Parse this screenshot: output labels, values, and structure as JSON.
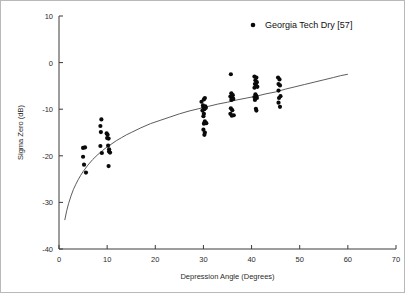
{
  "figure": {
    "background_color": "#ffffff",
    "border_color": "#b9b9b9",
    "marker_color": "#0a0a0a",
    "curve_color": "#4a4a4a",
    "axis_color": "#3a3a3a"
  },
  "legend": {
    "position": "top-right",
    "marker": "filled-circle",
    "entries": [
      {
        "label": "Georgia Tech Dry [57]",
        "marker": "filled-circle",
        "color": "#0a0a0a"
      }
    ]
  },
  "chart_data": {
    "type": "scatter",
    "title": "",
    "xlabel": "Depression Angle (Degrees)",
    "ylabel": "Sigma Zero (dB)",
    "xlim": [
      0,
      70
    ],
    "ylim": [
      -40,
      10
    ],
    "xticks": [
      0,
      10,
      20,
      30,
      40,
      50,
      60,
      70
    ],
    "yticks": [
      10,
      0,
      -10,
      -20,
      -30,
      -40
    ],
    "xticklabels": [
      "0",
      "10",
      "20",
      "30",
      "40",
      "50",
      "60",
      "70"
    ],
    "yticklabels": [
      "10",
      "0",
      "-10",
      "-20",
      "-30",
      "-40"
    ],
    "grid": false,
    "legend_position": "top-right",
    "series": [
      {
        "name": "Georgia Tech Dry [57]",
        "marker": "filled-circle",
        "color": "#0a0a0a",
        "points": [
          [
            5.0,
            -18.3
          ],
          [
            5.4,
            -18.2
          ],
          [
            5.0,
            -20.2
          ],
          [
            5.2,
            -21.9
          ],
          [
            5.6,
            -23.6
          ],
          [
            8.8,
            -12.2
          ],
          [
            8.6,
            -13.6
          ],
          [
            8.7,
            -14.9
          ],
          [
            8.6,
            -17.9
          ],
          [
            8.9,
            -19.4
          ],
          [
            9.9,
            -15.2
          ],
          [
            10.1,
            -15.5
          ],
          [
            10.0,
            -16.2
          ],
          [
            10.3,
            -16.3
          ],
          [
            10.2,
            -17.8
          ],
          [
            10.4,
            -18.6
          ],
          [
            10.4,
            -19.1
          ],
          [
            10.6,
            -19.3
          ],
          [
            10.3,
            -22.2
          ],
          [
            29.6,
            -8.4
          ],
          [
            30.1,
            -7.9
          ],
          [
            30.3,
            -7.6
          ],
          [
            29.9,
            -9.2
          ],
          [
            30.0,
            -9.6
          ],
          [
            30.4,
            -9.4
          ],
          [
            30.2,
            -10.0
          ],
          [
            29.8,
            -10.3
          ],
          [
            30.5,
            -9.7
          ],
          [
            30.1,
            -11.0
          ],
          [
            30.0,
            -11.5
          ],
          [
            30.3,
            -12.6
          ],
          [
            30.1,
            -13.1
          ],
          [
            30.6,
            -13.0
          ],
          [
            30.0,
            -14.4
          ],
          [
            30.3,
            -15.0
          ],
          [
            30.2,
            -15.5
          ],
          [
            35.7,
            -2.5
          ],
          [
            35.8,
            -6.6
          ],
          [
            36.1,
            -7.0
          ],
          [
            35.6,
            -7.3
          ],
          [
            36.0,
            -7.6
          ],
          [
            35.8,
            -8.0
          ],
          [
            36.2,
            -7.8
          ],
          [
            35.7,
            -9.8
          ],
          [
            36.0,
            -10.2
          ],
          [
            35.6,
            -11.0
          ],
          [
            36.3,
            -11.3
          ],
          [
            35.9,
            -11.4
          ],
          [
            40.6,
            -3.0
          ],
          [
            41.0,
            -3.2
          ],
          [
            40.8,
            -3.8
          ],
          [
            41.1,
            -4.2
          ],
          [
            40.7,
            -4.6
          ],
          [
            41.0,
            -5.0
          ],
          [
            40.6,
            -5.4
          ],
          [
            41.2,
            -5.2
          ],
          [
            40.8,
            -6.8
          ],
          [
            41.0,
            -7.2
          ],
          [
            40.6,
            -7.4
          ],
          [
            41.1,
            -7.6
          ],
          [
            40.7,
            -8.0
          ],
          [
            40.9,
            -9.9
          ],
          [
            41.0,
            -10.3
          ],
          [
            45.5,
            -3.2
          ],
          [
            45.8,
            -3.6
          ],
          [
            45.6,
            -4.6
          ],
          [
            45.9,
            -4.9
          ],
          [
            45.6,
            -6.0
          ],
          [
            46.0,
            -7.2
          ],
          [
            45.7,
            -7.6
          ],
          [
            45.6,
            -8.6
          ],
          [
            45.9,
            -9.5
          ]
        ]
      }
    ],
    "fit_curve": {
      "name": "fitted-trend",
      "color": "#4a4a4a",
      "points": [
        [
          1.2,
          -33.8
        ],
        [
          1.6,
          -31.8
        ],
        [
          2.0,
          -30.2
        ],
        [
          2.5,
          -28.6
        ],
        [
          3.0,
          -27.2
        ],
        [
          3.5,
          -26.1
        ],
        [
          4.0,
          -25.1
        ],
        [
          4.5,
          -24.2
        ],
        [
          5.0,
          -23.4
        ],
        [
          6.0,
          -22.0
        ],
        [
          7.0,
          -20.8
        ],
        [
          8.0,
          -19.8
        ],
        [
          9.0,
          -18.9
        ],
        [
          10.0,
          -18.1
        ],
        [
          11.0,
          -17.4
        ],
        [
          12.0,
          -16.7
        ],
        [
          13.0,
          -16.1
        ],
        [
          14.0,
          -15.5
        ],
        [
          15.0,
          -15.0
        ],
        [
          17.0,
          -14.0
        ],
        [
          19.0,
          -13.1
        ],
        [
          21.0,
          -12.4
        ],
        [
          23.0,
          -11.7
        ],
        [
          25.0,
          -11.0
        ],
        [
          27.0,
          -10.4
        ],
        [
          29.0,
          -9.9
        ],
        [
          31.0,
          -9.4
        ],
        [
          33.0,
          -8.9
        ],
        [
          35.0,
          -8.5
        ],
        [
          37.0,
          -8.0
        ],
        [
          39.0,
          -7.6
        ],
        [
          41.0,
          -7.2
        ],
        [
          43.0,
          -6.7
        ],
        [
          45.0,
          -6.3
        ],
        [
          47.0,
          -5.7
        ],
        [
          49.0,
          -5.2
        ],
        [
          51.0,
          -4.7
        ],
        [
          53.0,
          -4.2
        ],
        [
          55.0,
          -3.7
        ],
        [
          57.0,
          -3.2
        ],
        [
          58.5,
          -2.8
        ],
        [
          60.0,
          -2.5
        ]
      ]
    }
  }
}
